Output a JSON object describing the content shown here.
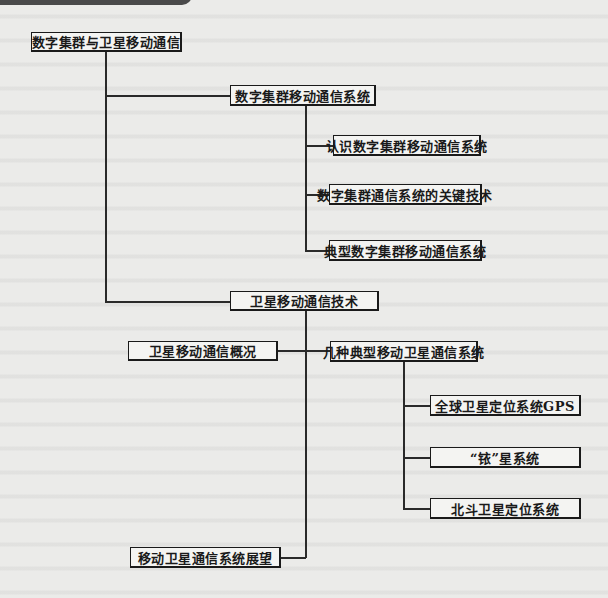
{
  "diagram": {
    "type": "tree",
    "root": {
      "label": "数字集群与卫星移动通信",
      "children": [
        {
          "label": "数字集群移动通信系统",
          "children": [
            {
              "label": "认识数字集群移动通信系统"
            },
            {
              "label": "数字集群通信系统的关键技术"
            },
            {
              "label": "典型数字集群移动通信系统"
            }
          ]
        },
        {
          "label": "卫星移动通信技术",
          "children": [
            {
              "label": "卫星移动通信概况"
            },
            {
              "label": "几种典型移动卫星通信系统",
              "children": [
                {
                  "label": "全球卫星定位系统GPS"
                },
                {
                  "label": "“铱”星系统"
                },
                {
                  "label": "北斗卫星定位系统"
                }
              ]
            },
            {
              "label": "移动卫星通信系统展望"
            }
          ]
        }
      ]
    }
  },
  "nodes": {
    "root": "数字集群与卫星移动通信",
    "trunking_system": "数字集群移动通信系统",
    "trunking_intro": "认识数字集群移动通信系统",
    "trunking_key_tech": "数字集群通信系统的关键技术",
    "trunking_typical": "典型数字集群移动通信系统",
    "satellite_tech": "卫星移动通信技术",
    "satellite_overview": "卫星移动通信概况",
    "satellite_typical": "几种典型移动卫星通信系统",
    "gps": "全球卫星定位系统GPS",
    "iridium": "“铱”星系统",
    "beidou": "北斗卫星定位系统",
    "satellite_outlook": "移动卫星通信系统展望"
  },
  "colors": {
    "background": "#ebebe9",
    "box_fill": "#f4f4f2",
    "line": "#1a1a1a",
    "header_bar": "#4a4a4a"
  }
}
